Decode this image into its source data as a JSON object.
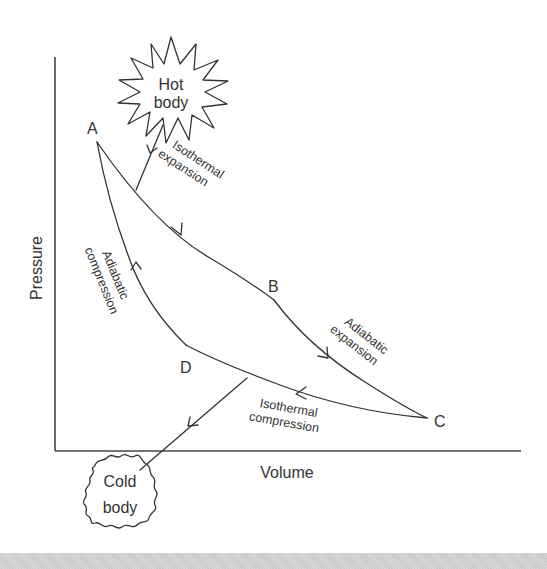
{
  "diagram": {
    "type": "Carnot cycle pressure-volume diagram",
    "axes": {
      "x_label": "Volume",
      "y_label": "Pressure"
    },
    "points": [
      {
        "id": "A",
        "label": "A"
      },
      {
        "id": "B",
        "label": "B"
      },
      {
        "id": "C",
        "label": "C"
      },
      {
        "id": "D",
        "label": "D"
      }
    ],
    "processes": {
      "ab": {
        "line1": "Isothermal",
        "line2": "expansion"
      },
      "bc": {
        "line1": "Adiabatic",
        "line2": "expansion"
      },
      "cd": {
        "line1": "Isothermal",
        "line2": "compression"
      },
      "da": {
        "line1": "Adiabatic",
        "line2": "compression"
      }
    },
    "reservoirs": {
      "hot": {
        "line1": "Hot",
        "line2": "body"
      },
      "cold": {
        "line1": "Cold",
        "line2": "body"
      }
    },
    "colors": {
      "ink": "#333333",
      "background": "#ffffff",
      "footer": "#d2d2d2"
    }
  }
}
